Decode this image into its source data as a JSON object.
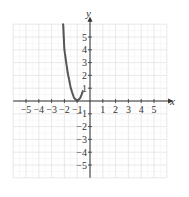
{
  "chart_data": {
    "type": "line",
    "title": "",
    "xlabel": "x",
    "ylabel": "y",
    "xlim": [
      -6,
      6
    ],
    "ylim": [
      -6,
      6
    ],
    "grid": true,
    "x_ticks": [
      "-5",
      "-4",
      "-3",
      "-2",
      "-1",
      "1",
      "2",
      "3",
      "4",
      "5"
    ],
    "y_ticks": [
      "5",
      "4",
      "3",
      "2",
      "1",
      "-1",
      "-2",
      "-3",
      "-4",
      "-5"
    ],
    "series": [
      {
        "name": "curve",
        "color": "#555555",
        "x": [
          -2.1,
          -2.0,
          -1.75,
          -1.5,
          -1.25,
          -1.0,
          -0.75,
          -0.55
        ],
        "y": [
          6.0,
          4.0,
          2.25,
          1.0,
          0.25,
          0.0,
          0.25,
          0.8
        ]
      }
    ]
  }
}
